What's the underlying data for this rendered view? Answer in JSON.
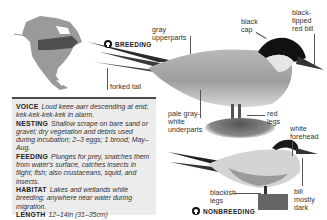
{
  "range_map": {
    "icon": "north-america-range-map-icon"
  },
  "breeding": {
    "badge": "BREEDING",
    "labels": {
      "gray_upperparts": "gray\nupperparts",
      "black_cap": "black\ncap",
      "bill": "black-\ntipped\nred bill",
      "forked_tail": "forked tail",
      "underparts": "pale gray-\nwhite\nunderparts",
      "legs": "red\nlegs"
    }
  },
  "nonbreeding": {
    "badge": "NONBREEDING",
    "labels": {
      "forehead": "white\nforehead",
      "legs": "blackish\nlegs",
      "bill": "bill\nmostly\ndark"
    }
  },
  "facts": [
    {
      "key": "VOICE",
      "value": "Loud keee-aarr descending at end; kek-kek-kek-kek in alarm."
    },
    {
      "key": "NESTING",
      "value": "Shallow scrape on bare sand or gravel; dry vegetation and debris used during incubation; 2–3 eggs; 1 brood; May–Aug."
    },
    {
      "key": "FEEDING",
      "value": "Plunges for prey, snatches them from water's surface, catches insects in flight; fish; also crustaceans, squid, and insects."
    },
    {
      "key": "HABITAT",
      "value": "Lakes and wetlands while breeding; anywhere near water during migration."
    },
    {
      "key": "LENGTH",
      "value": "12–14in (31–35cm)"
    },
    {
      "key": "WINGSPAN",
      "value": "30–31in (75–80cm)"
    }
  ],
  "colors": {
    "box_bg": "#ececec",
    "box_rule": "#4a4a4a",
    "text": "#222222"
  }
}
